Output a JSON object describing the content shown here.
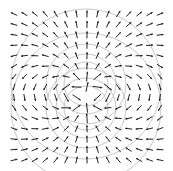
{
  "figure": {
    "field_type": "dipole",
    "dipole_direction": "up",
    "grid": {
      "columns": 15,
      "rows": 15
    },
    "contours": {
      "count": 4,
      "color": "#b8b8b8"
    },
    "arrow_color": "#222222",
    "background": "#ffffff"
  }
}
